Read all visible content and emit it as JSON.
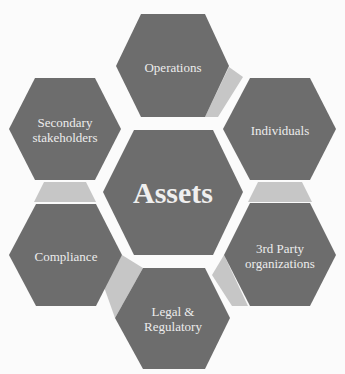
{
  "diagram": {
    "type": "hexagon-cluster",
    "center": {
      "label": "Assets"
    },
    "nodes": [
      {
        "id": "operations",
        "label": "Operations"
      },
      {
        "id": "individuals",
        "label": "Individuals"
      },
      {
        "id": "third-party",
        "label": "3rd Party organizations",
        "line1": "3rd Party",
        "line2": "organizations"
      },
      {
        "id": "legal",
        "label": "Legal & Regulatory",
        "line1": "Legal &",
        "line2": "Regulatory"
      },
      {
        "id": "compliance",
        "label": "Compliance"
      },
      {
        "id": "secondary",
        "label": "Secondary stakeholders",
        "line1": "Secondary",
        "line2": "stakeholders"
      }
    ],
    "colors": {
      "hexagon": "#6d6d6d",
      "connector": "#c6c6c6",
      "text": "#ececec",
      "background": "#fbfbfb"
    }
  }
}
